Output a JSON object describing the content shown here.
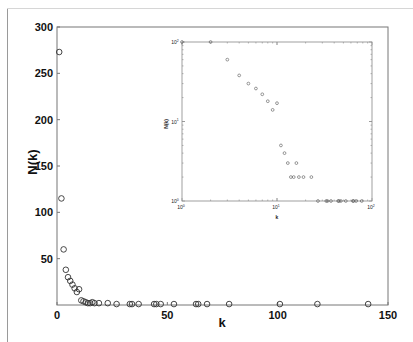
{
  "chart_data": [
    {
      "type": "scatter",
      "title": "",
      "xlabel": "k",
      "ylabel": "N(k)",
      "xlim": [
        0,
        150
      ],
      "ylim": [
        0,
        300
      ],
      "xticks": [
        0,
        50,
        100,
        150
      ],
      "yticks": [
        50,
        100,
        150,
        200,
        250,
        300
      ],
      "xtick_labels": [
        "0",
        "50",
        "100",
        "150"
      ],
      "ytick_labels": [
        "50",
        "100",
        "150",
        "200",
        "250",
        "300"
      ],
      "grid": false,
      "marker": "open-circle",
      "x": [
        1,
        2,
        3,
        4,
        5,
        6,
        7,
        8,
        9,
        10,
        11,
        12,
        13,
        14,
        15,
        16,
        17,
        19,
        23,
        27,
        33,
        34,
        37,
        44,
        45,
        47,
        53,
        63,
        64,
        68,
        78,
        101,
        118,
        141
      ],
      "y": [
        273,
        115,
        60,
        38,
        30,
        26,
        22,
        18,
        14,
        17,
        5,
        4,
        3,
        2,
        2,
        3,
        2,
        2,
        2,
        1,
        1,
        1,
        1,
        1,
        1,
        1,
        1,
        1,
        1,
        1,
        1,
        1,
        1,
        1
      ]
    },
    {
      "type": "scatter",
      "title": "",
      "role": "inset",
      "xlabel": "k",
      "ylabel": "N(k)",
      "xscale": "log",
      "yscale": "log",
      "xlim": [
        1,
        100
      ],
      "ylim": [
        1,
        100
      ],
      "xtick_labels": [
        "10^0",
        "10^1",
        "10^2"
      ],
      "ytick_labels": [
        "10^0",
        "10^1",
        "10^2"
      ],
      "grid": false,
      "marker": "open-circle",
      "x": [
        1,
        2,
        3,
        4,
        5,
        6,
        7,
        8,
        9,
        10,
        11,
        12,
        13,
        14,
        15,
        16,
        17,
        19,
        23,
        27,
        33,
        34,
        37,
        44,
        45,
        47,
        53,
        63,
        64,
        68,
        78,
        101,
        118,
        141
      ],
      "y": [
        273,
        115,
        60,
        38,
        30,
        26,
        22,
        18,
        14,
        17,
        5,
        4,
        3,
        2,
        2,
        3,
        2,
        2,
        2,
        1,
        1,
        1,
        1,
        1,
        1,
        1,
        1,
        1,
        1,
        1,
        1,
        1,
        1,
        1
      ]
    }
  ],
  "main": {
    "xlabel": "k",
    "ylabel": "N(k)",
    "xtick_labels": [
      "0",
      "50",
      "100",
      "150"
    ],
    "ytick_labels": [
      "50",
      "100",
      "150",
      "200",
      "250",
      "300"
    ]
  },
  "inset": {
    "xlabel": "k",
    "ylabel": "N(k)",
    "xtick_base": "10",
    "xtick_exps": [
      "0",
      "1",
      "2"
    ],
    "ytick_base": "10",
    "ytick_exps": [
      "0",
      "1",
      "2"
    ]
  },
  "colors": {
    "axis": "#555555",
    "marker": "#333333",
    "inset_marker": "#555555",
    "background": "#ffffff"
  }
}
